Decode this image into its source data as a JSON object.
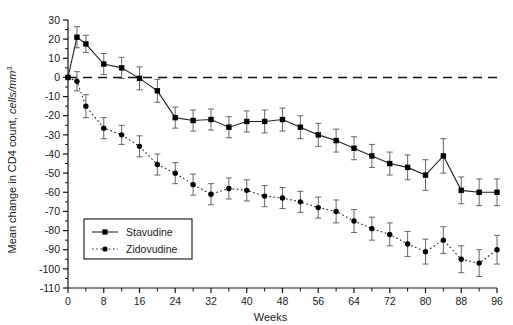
{
  "figure": {
    "background": "#ffffff",
    "series_color_stavudine": "#000000",
    "series_color_zidovudine": "#000000"
  },
  "axes": {
    "x_title": "Weeks",
    "y_title_plain": "Mean change in CD4 count, cells/mm",
    "y_title_prefix": "Mean change in CD4 count, ",
    "y_title_italic": "cells/mm",
    "y_title_exponent": "3",
    "x_ticks": [
      "0",
      "8",
      "16",
      "24",
      "32",
      "40",
      "48",
      "56",
      "64",
      "72",
      "80",
      "88",
      "96"
    ],
    "x_minor_ticks": [
      4,
      12,
      20,
      28,
      36,
      44,
      52,
      60,
      68,
      76,
      84,
      92
    ],
    "y_ticks": [
      "30",
      "20",
      "10",
      "0",
      "-10",
      "-20",
      "-30",
      "-40",
      "-50",
      "-60",
      "-70",
      "-80",
      "-90",
      "-100",
      "-110"
    ]
  },
  "legend": {
    "items": [
      {
        "label": "Stavudine",
        "style": "solid",
        "marker": "square"
      },
      {
        "label": "Zidovudine",
        "style": "dotted",
        "marker": "circle"
      }
    ]
  },
  "chart_data": {
    "type": "line",
    "title": "",
    "xlabel": "Weeks",
    "ylabel": "Mean change in CD4 count, cells/mm^3",
    "xlim": [
      0,
      96
    ],
    "ylim": [
      -110,
      30
    ],
    "grid": false,
    "legend_position": "bottom-left",
    "errorbars": true,
    "reference_line": {
      "y": 0,
      "style": "dashed"
    },
    "x": [
      0,
      2,
      4,
      8,
      12,
      16,
      20,
      24,
      28,
      32,
      36,
      40,
      44,
      48,
      52,
      56,
      60,
      64,
      68,
      72,
      76,
      80,
      84,
      88,
      92,
      96
    ],
    "series": [
      {
        "name": "Stavudine",
        "style": "solid",
        "marker": "square",
        "values": [
          0,
          21,
          17.5,
          7,
          5,
          -0.5,
          -7,
          -21,
          -22.5,
          -22,
          -26,
          -23,
          -23,
          -22,
          -26,
          -30,
          -33,
          -37,
          -41,
          -45,
          -47,
          -51,
          -41,
          -59,
          -60,
          -60
        ],
        "errors": [
          0,
          5.5,
          4.5,
          5.5,
          5.5,
          6,
          6,
          5.5,
          5.5,
          5.5,
          5.5,
          5.5,
          6,
          6,
          6,
          6,
          6,
          6,
          6,
          6,
          6.5,
          8,
          9,
          7,
          7,
          7
        ]
      },
      {
        "name": "Zidovudine",
        "style": "dotted",
        "marker": "circle",
        "values": [
          0,
          -2,
          -15,
          -26.5,
          -30,
          -36,
          -45.5,
          -50,
          -56,
          -61,
          -58,
          -59,
          -62,
          -63,
          -65,
          -68,
          -70,
          -75,
          -79,
          -82,
          -87,
          -91,
          -85,
          -95,
          -97,
          -90
        ],
        "errors": [
          0,
          5,
          6,
          5.5,
          5,
          5.5,
          5.5,
          5.5,
          5.5,
          5.5,
          5.5,
          5.5,
          5.5,
          5.5,
          5.5,
          5.5,
          6,
          6,
          6,
          6,
          6.5,
          6.5,
          7,
          7,
          7,
          7.5
        ]
      }
    ]
  }
}
